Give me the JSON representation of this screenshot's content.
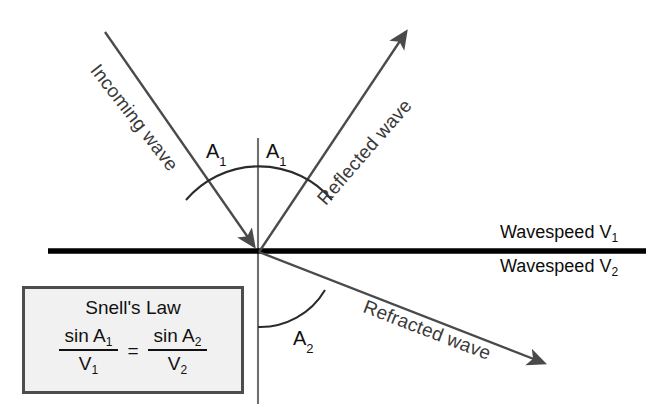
{
  "diagram": {
    "colors": {
      "ray": "#4a4a4a",
      "interface": "#000000",
      "normal": "#6b6b6b",
      "arc": "#2b2b2b",
      "box_fill": "#f1f1f1",
      "box_border": "#4d4d4d",
      "text": "#111111",
      "background": "#ffffff"
    },
    "rays": [
      {
        "id": "incoming-wave",
        "label": "Incoming wave",
        "label_rotation_deg": 52,
        "from": [
          105,
          32
        ],
        "to": [
          259,
          252
        ],
        "arrowhead": "at-interface"
      },
      {
        "id": "reflected-wave",
        "label": "Reflected wave",
        "label_rotation_deg": -49,
        "from": [
          259,
          252
        ],
        "to": [
          410,
          27
        ],
        "arrowhead": "at-end"
      },
      {
        "id": "refracted-wave",
        "label": "Refracted wave",
        "label_rotation_deg": 21,
        "from": [
          259,
          252
        ],
        "to": [
          550,
          366
        ],
        "arrowhead": "at-end"
      }
    ],
    "normal_line": {
      "id": "normal-line",
      "from": [
        258,
        138
      ],
      "to": [
        258,
        404
      ]
    },
    "interface_line": {
      "id": "interface-line",
      "from": [
        48,
        251
      ],
      "to": [
        646,
        251
      ]
    },
    "angles": [
      {
        "id": "angle-incidence",
        "base": "A",
        "sub": "1",
        "x": 206,
        "y": 140
      },
      {
        "id": "angle-reflection",
        "base": "A",
        "sub": "1",
        "x": 266,
        "y": 140
      },
      {
        "id": "angle-refraction",
        "base": "A",
        "sub": "2",
        "x": 293,
        "y": 327
      }
    ],
    "speeds": [
      {
        "id": "wavespeed-upper",
        "text": "Wavespeed V",
        "sub": "1",
        "x": 500,
        "y": 222
      },
      {
        "id": "wavespeed-lower",
        "text": "Wavespeed V",
        "sub": "2",
        "x": 500,
        "y": 256
      }
    ],
    "snell_box": {
      "title": "Snell's Law",
      "left_numerator": "sin A",
      "left_numerator_sub": "1",
      "left_denominator": "V",
      "left_denominator_sub": "1",
      "equals": "=",
      "right_numerator": "sin A",
      "right_numerator_sub": "2",
      "right_denominator": "V",
      "right_denominator_sub": "2"
    }
  }
}
